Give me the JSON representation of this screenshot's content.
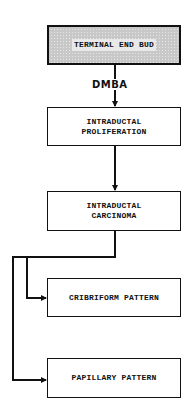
{
  "diagram": {
    "type": "flowchart",
    "colors": {
      "line": "#111111",
      "box_border": "#111111",
      "start_box_fill": "#c8c8c8",
      "background": "#ffffff"
    },
    "nodes": [
      {
        "id": "terminal_end_bud",
        "lines": [
          "TERMINAL END BUD"
        ],
        "style": "stippled"
      },
      {
        "id": "intraductal_proliferation",
        "lines": [
          "INTRADUCTAL",
          "PROLIFERATION"
        ],
        "style": "plain"
      },
      {
        "id": "intraductal_carcinoma",
        "lines": [
          "INTRADUCTAL",
          "CARCINOMA"
        ],
        "style": "plain"
      },
      {
        "id": "cribriform_pattern",
        "lines": [
          "CRIBRIFORM PATTERN"
        ],
        "style": "plain"
      },
      {
        "id": "papillary_pattern",
        "lines": [
          "PAPILLARY PATTERN"
        ],
        "style": "plain"
      }
    ],
    "edges": [
      {
        "from": "terminal_end_bud",
        "to": "intraductal_proliferation",
        "label": "DMBA"
      },
      {
        "from": "intraductal_proliferation",
        "to": "intraductal_carcinoma",
        "label": ""
      },
      {
        "from": "intraductal_carcinoma",
        "to": "cribriform_pattern",
        "label": ""
      },
      {
        "from": "intraductal_carcinoma",
        "to": "papillary_pattern",
        "label": ""
      }
    ],
    "edge_label_dmba": "DMBA"
  }
}
